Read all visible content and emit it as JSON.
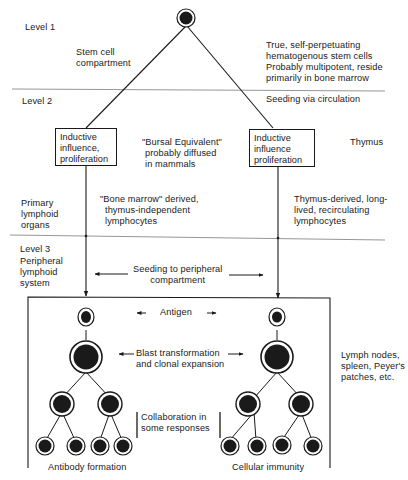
{
  "levels": {
    "level1": "Level 1",
    "level2": "Level 2",
    "level3": "Level 3"
  },
  "level1": {
    "stem_cell_compartment": [
      "Stem cell",
      "compartment"
    ],
    "description": [
      "True, self-perpetuating",
      "hematogenous stem cells",
      "Probably multipotent, reside",
      "primarily in bone marrow"
    ]
  },
  "level2": {
    "seeding": "Seeding via circulation",
    "left_box": [
      "Inductive",
      "influence,",
      "proliferation"
    ],
    "right_box": [
      "Inductive",
      "influence",
      "proliferation"
    ],
    "bursal": [
      "\"Bursal Equivalent\"",
      "probably diffused",
      "in mammals"
    ],
    "thymus": "Thymus",
    "primary_organs": [
      "Primary",
      "lymphoid",
      "organs"
    ],
    "bone_marrow_lymphocytes": [
      "\"Bone marrow\" derived,",
      "thymus-independent",
      "lymphocytes"
    ],
    "thymus_lymphocytes": [
      "Thymus-derived, long-",
      "lived, recirculating",
      "lymphocytes"
    ]
  },
  "level3": {
    "peripheral_system": [
      "Peripheral",
      "lymphoid",
      "system"
    ],
    "seeding_peripheral": [
      "Seeding to peripheral",
      "compartment"
    ],
    "antigen": "Antigen",
    "blast": [
      "Blast transformation",
      "and clonal expansion"
    ],
    "collaboration": [
      "Collaboration in",
      "some responses"
    ],
    "lymph_nodes": [
      "Lymph nodes,",
      "spleen, Peyer's",
      "patches, etc."
    ],
    "antibody_formation": "Antibody formation",
    "cellular_immunity": "Cellular immunity"
  },
  "colors": {
    "ink": "#1a1a1a",
    "divider": "#8a8a8a",
    "background": "#ffffff"
  }
}
